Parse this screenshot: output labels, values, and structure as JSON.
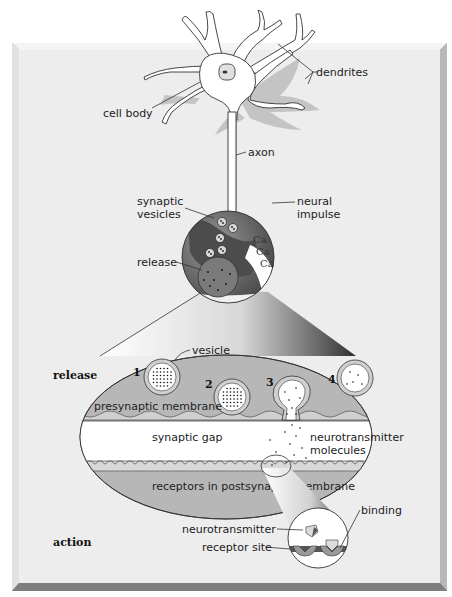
{
  "figure": {
    "colors": {
      "panel": "#ededed",
      "panel_bevel_light": "#f6f6f6",
      "panel_bevel_dark": "#9a9a9a",
      "ellipse_fill": "#b7b7b7",
      "gap_fill": "#ffffff",
      "shadow": "#c4c4c4",
      "terminal_dark": "#5a5a5a"
    }
  },
  "neuron_labels": {
    "dendrites": "dendrites",
    "cell_body": "cell body",
    "axon": "axon"
  },
  "terminal_labels": {
    "synaptic_vesicles_line1": "synaptic",
    "synaptic_vesicles_line2": "vesicles",
    "neural_impulse_line1": "neural",
    "neural_impulse_line2": "impulse",
    "release": "release",
    "calcium": [
      "Ca",
      "Ca",
      "Ca"
    ]
  },
  "synapse_labels": {
    "stage_release": "release",
    "stage_action": "action",
    "vesicle": "vesicle",
    "steps": [
      "1",
      "2",
      "3",
      "4"
    ],
    "presynaptic_membrane": "presynaptic membrane",
    "synaptic_gap": "synaptic gap",
    "neurotransmitter_molecules_line1": "neurotransmitter",
    "neurotransmitter_molecules_line2": "molecules",
    "postsynaptic_receptors": "receptors in postsynaptic membrane"
  },
  "receptor_labels": {
    "binding": "binding",
    "neurotransmitter": "neurotransmitter",
    "receptor_site": "receptor site"
  }
}
